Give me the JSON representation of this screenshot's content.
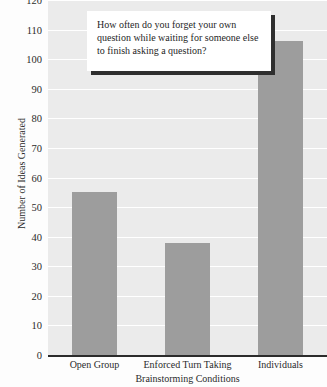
{
  "chart_data": {
    "type": "bar",
    "title": "How often do you forget your own question while waiting for someone else to finish asking a question?",
    "xlabel": "Brainstorming Conditions",
    "ylabel": "Number of Ideas Generated",
    "categories": [
      "Open Group",
      "Enforced Turn Taking",
      "Individuals"
    ],
    "values": [
      55,
      38,
      106
    ],
    "ylim": [
      0,
      120
    ],
    "yticks": [
      0,
      10,
      20,
      30,
      40,
      50,
      60,
      70,
      80,
      90,
      100,
      110,
      120
    ],
    "ytick_labels": [
      "0",
      "10",
      "20",
      "30",
      "40",
      "50",
      "60",
      "70",
      "80",
      "90",
      "100",
      "110",
      "120"
    ],
    "grid": true,
    "legend": false,
    "colors": {
      "bar": "#9d9d9d",
      "plot_background": "#ebebeb",
      "gridline": "#ffffff",
      "axis": "#2b2b2b",
      "title_box_background": "#ffffff",
      "title_box_shadow": "#2f2f2f",
      "text": "#2b2b2b"
    }
  }
}
